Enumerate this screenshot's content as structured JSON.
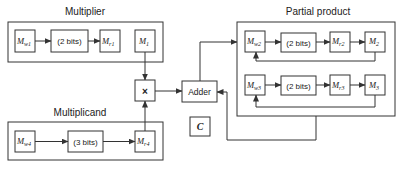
{
  "diagram": {
    "multiplier": {
      "label": "Multiplier",
      "registers": [
        {
          "name": "M",
          "sub": "w1"
        },
        {
          "name": "(2 bits)"
        },
        {
          "name": "M",
          "sub": "r1"
        },
        {
          "name": "M",
          "sub": "1"
        }
      ]
    },
    "multiplicand": {
      "label": "Multiplicand",
      "registers": [
        {
          "name": "M",
          "sub": "w4"
        },
        {
          "name": "(3 bits)"
        },
        {
          "name": "M",
          "sub": "r4"
        }
      ]
    },
    "multiply_op": {
      "label": "×"
    },
    "adder": {
      "label": "Adder"
    },
    "carry": {
      "label": "C"
    },
    "partial_product": {
      "label": "Partial product",
      "rows": [
        {
          "registers": [
            {
              "name": "M",
              "sub": "w2"
            },
            {
              "name": "(2 bits)"
            },
            {
              "name": "M",
              "sub": "r2"
            },
            {
              "name": "M",
              "sub": "2"
            }
          ]
        },
        {
          "registers": [
            {
              "name": "M",
              "sub": "w3"
            },
            {
              "name": "(2 bits)"
            },
            {
              "name": "M",
              "sub": "r3"
            },
            {
              "name": "M",
              "sub": "3"
            }
          ]
        }
      ]
    }
  }
}
